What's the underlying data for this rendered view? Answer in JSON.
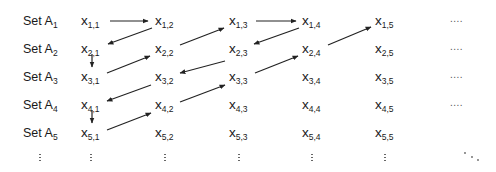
{
  "diagram": {
    "type": "diagonal enumeration of union of countable sets",
    "row_labels": [
      {
        "prefix": "Set A",
        "sub": "1"
      },
      {
        "prefix": "Set A",
        "sub": "2"
      },
      {
        "prefix": "Set A",
        "sub": "3"
      },
      {
        "prefix": "Set A",
        "sub": "4"
      },
      {
        "prefix": "Set A",
        "sub": "5"
      }
    ],
    "rows": [
      [
        {
          "v": "x",
          "s": "1,1"
        },
        {
          "v": "x",
          "s": "1,2"
        },
        {
          "v": "x",
          "s": "1,3"
        },
        {
          "v": "x",
          "s": "1,4"
        },
        {
          "v": "x",
          "s": "1,5"
        }
      ],
      [
        {
          "v": "x",
          "s": "2,1"
        },
        {
          "v": "x",
          "s": "2,2"
        },
        {
          "v": "x",
          "s": "2,3"
        },
        {
          "v": "x",
          "s": "2,4"
        },
        {
          "v": "x",
          "s": "2,5"
        }
      ],
      [
        {
          "v": "x",
          "s": "3,1"
        },
        {
          "v": "x",
          "s": "3,2"
        },
        {
          "v": "x",
          "s": "3,3"
        },
        {
          "v": "x",
          "s": "3,4"
        },
        {
          "v": "x",
          "s": "3,5"
        }
      ],
      [
        {
          "v": "x",
          "s": "4,1"
        },
        {
          "v": "x",
          "s": "4,2"
        },
        {
          "v": "x",
          "s": "4,3"
        },
        {
          "v": "x",
          "s": "4,4"
        },
        {
          "v": "x",
          "s": "4,5"
        }
      ],
      [
        {
          "v": "x",
          "s": "5,1"
        },
        {
          "v": "x",
          "s": "5,2"
        },
        {
          "v": "x",
          "s": "5,3"
        },
        {
          "v": "x",
          "s": "5,4"
        },
        {
          "v": "x",
          "s": "5,5"
        }
      ]
    ],
    "row_continuation": "....",
    "rows_with_continuation": [
      0,
      1,
      2,
      3
    ],
    "column_continuation": "⋮",
    "diagonal_continuation": "⋱",
    "arrow_path": [
      {
        "from": "1,1",
        "to": "1,2",
        "x1": 110,
        "y1": 21,
        "x2": 148,
        "y2": 21
      },
      {
        "from": "1,2",
        "to": "2,1",
        "x1": 152,
        "y1": 28,
        "x2": 108,
        "y2": 44
      },
      {
        "from": "2,1",
        "to": "3,1",
        "x1": 92,
        "y1": 54,
        "x2": 92,
        "y2": 67
      },
      {
        "from": "3,1",
        "to": "2,2",
        "x1": 107,
        "y1": 73,
        "x2": 150,
        "y2": 56
      },
      {
        "from": "2,2",
        "to": "1,3",
        "x1": 180,
        "y1": 45,
        "x2": 224,
        "y2": 28
      },
      {
        "from": "1,3",
        "to": "1,4",
        "x1": 256,
        "y1": 21,
        "x2": 296,
        "y2": 21
      },
      {
        "from": "1,4",
        "to": "2,3",
        "x1": 299,
        "y1": 28,
        "x2": 254,
        "y2": 44
      },
      {
        "from": "2,3",
        "to": "3,2",
        "x1": 225,
        "y1": 61,
        "x2": 180,
        "y2": 73
      },
      {
        "from": "3,2",
        "to": "4,1",
        "x1": 151,
        "y1": 85,
        "x2": 107,
        "y2": 101
      },
      {
        "from": "4,1",
        "to": "5,1",
        "x1": 92,
        "y1": 110,
        "x2": 92,
        "y2": 123
      },
      {
        "from": "5,1",
        "to": "4,2",
        "x1": 107,
        "y1": 130,
        "x2": 151,
        "y2": 113
      },
      {
        "from": "4,2",
        "to": "3,3",
        "x1": 180,
        "y1": 102,
        "x2": 225,
        "y2": 85
      },
      {
        "from": "3,3",
        "to": "2,4",
        "x1": 255,
        "y1": 73,
        "x2": 298,
        "y2": 56
      },
      {
        "from": "2,4",
        "to": "1,5",
        "x1": 328,
        "y1": 45,
        "x2": 371,
        "y2": 27
      }
    ],
    "colors": {
      "text": "#1a1a1a",
      "arrow": "#222222",
      "dots": "#666666",
      "background": "#ffffff"
    }
  }
}
